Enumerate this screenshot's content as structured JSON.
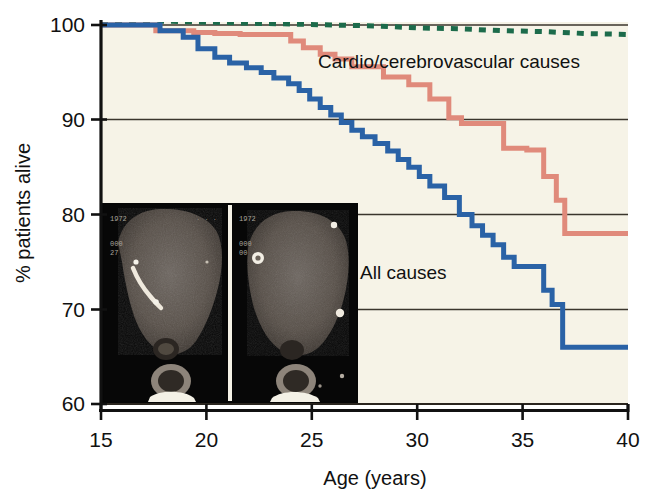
{
  "chart_data": {
    "type": "line",
    "subtype": "kaplan-meier-step",
    "title": "",
    "xlabel": "Age (years)",
    "ylabel": "% patients alive",
    "xlim": [
      15,
      40
    ],
    "ylim": [
      60,
      100
    ],
    "xticks": [
      15,
      20,
      25,
      30,
      35,
      40
    ],
    "xtick_labels": [
      "15",
      "20",
      "25",
      "30",
      "35",
      "40"
    ],
    "yticks": [
      60,
      70,
      80,
      90,
      100
    ],
    "ytick_labels": [
      "60",
      "70",
      "80",
      "90",
      "100"
    ],
    "grid": "horizontal",
    "gridlines_at": [
      70,
      80,
      90,
      100
    ],
    "legend_position": "inline-annotations",
    "plot_background": "#f6f3e7",
    "series": [
      {
        "name": "Other causes",
        "label_shown": "",
        "color": "#1c6b4b",
        "style": "dashed",
        "linewidth": 5,
        "x": [
          15,
          18,
          20,
          22,
          24,
          26,
          28,
          30,
          32,
          34,
          36,
          38,
          40
        ],
        "y": [
          100.4,
          100.4,
          100.3,
          100.2,
          100.1,
          100.0,
          99.9,
          99.7,
          99.6,
          99.4,
          99.3,
          99.1,
          99.0
        ]
      },
      {
        "name": "Cardio/cerebrovascular causes",
        "label_shown": "Cardio/cerebrovascular causes",
        "color": "#e08a7b",
        "style": "solid-step",
        "linewidth": 5,
        "x": [
          15.0,
          17.6,
          17.6,
          19.4,
          19.4,
          20.4,
          20.4,
          21.6,
          21.6,
          24.0,
          24.0,
          24.6,
          24.6,
          25.4,
          25.4,
          26.1,
          26.1,
          26.9,
          26.9,
          28.4,
          28.4,
          29.6,
          29.6,
          30.6,
          30.6,
          31.5,
          31.5,
          32.1,
          32.1,
          34.1,
          34.1,
          35.2,
          35.2,
          36.0,
          36.0,
          36.6,
          36.6,
          37.0,
          37.0,
          40.0
        ],
        "y": [
          100.0,
          100.0,
          99.4,
          99.4,
          99.2,
          99.2,
          99.1,
          99.1,
          99.0,
          99.0,
          98.3,
          98.3,
          97.6,
          97.6,
          96.9,
          96.9,
          96.4,
          96.4,
          95.6,
          95.6,
          94.5,
          94.5,
          93.7,
          93.7,
          92.2,
          92.2,
          90.2,
          90.2,
          89.6,
          89.6,
          87.0,
          87.0,
          86.8,
          86.8,
          84.0,
          84.0,
          81.5,
          81.5,
          78.0,
          78.0
        ]
      },
      {
        "name": "All causes",
        "label_shown": "All causes",
        "color": "#2a62a6",
        "style": "solid-step",
        "linewidth": 5,
        "x": [
          15.0,
          17.8,
          17.8,
          18.9,
          18.9,
          19.6,
          19.6,
          20.4,
          20.4,
          21.1,
          21.1,
          21.9,
          21.9,
          22.6,
          22.6,
          23.2,
          23.2,
          23.9,
          23.9,
          24.4,
          24.4,
          24.9,
          24.9,
          25.4,
          25.4,
          25.9,
          25.9,
          26.4,
          26.4,
          26.9,
          26.9,
          27.4,
          27.4,
          28.0,
          28.0,
          28.6,
          28.6,
          29.1,
          29.1,
          29.6,
          29.6,
          30.1,
          30.1,
          30.6,
          30.6,
          31.3,
          31.3,
          32.0,
          32.0,
          32.6,
          32.6,
          33.1,
          33.1,
          33.6,
          33.6,
          34.1,
          34.1,
          34.6,
          34.6,
          36.0,
          36.0,
          36.4,
          36.4,
          36.9,
          36.9,
          40.0
        ],
        "y": [
          100.0,
          100.0,
          99.4,
          99.4,
          98.7,
          98.7,
          97.5,
          97.5,
          96.6,
          96.6,
          96.0,
          96.0,
          95.5,
          95.5,
          95.0,
          95.0,
          94.4,
          94.4,
          93.8,
          93.8,
          93.1,
          93.1,
          92.2,
          92.2,
          91.3,
          91.3,
          90.5,
          90.5,
          89.7,
          89.7,
          88.9,
          88.9,
          88.2,
          88.2,
          87.5,
          87.5,
          86.7,
          86.7,
          85.8,
          85.8,
          85.0,
          85.0,
          84.0,
          84.0,
          83.0,
          83.0,
          81.8,
          81.8,
          80.0,
          80.0,
          78.8,
          78.8,
          77.8,
          77.8,
          76.8,
          76.8,
          75.5,
          75.5,
          74.5,
          74.5,
          72.0,
          72.0,
          70.5,
          70.5,
          66.0,
          66.0
        ]
      }
    ],
    "annotations": [
      {
        "name": "cardio-label",
        "text": "Cardio/cerebrovascular causes",
        "x": 27.5,
        "y": 97.0
      },
      {
        "name": "all-causes-label",
        "text": "All causes",
        "x": 26.6,
        "y": 73.3
      }
    ],
    "insets": [
      {
        "name": "ct-scan-left",
        "overlay_text": [
          "1972",
          "000",
          "27"
        ]
      },
      {
        "name": "ct-scan-right",
        "overlay_text": [
          "1972",
          "000",
          "00"
        ]
      }
    ]
  },
  "axes": {
    "y_title": "% patients alive",
    "x_title": "Age (years)"
  },
  "colors": {
    "all_causes": "#2a62a6",
    "cardio": "#e08a7b",
    "other": "#1c6b4b",
    "plot_bg": "#f6f3e7",
    "axis": "#1a1a1a",
    "grid": "#3a352c"
  }
}
